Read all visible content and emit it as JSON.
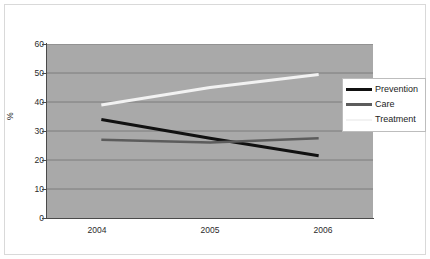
{
  "chart_data": {
    "type": "line",
    "title": "",
    "xlabel": "",
    "ylabel": "%",
    "categories": [
      "2004",
      "2005",
      "2006"
    ],
    "x": [
      2004,
      2005,
      2006
    ],
    "ylim": [
      0,
      60
    ],
    "yticks": [
      0,
      10,
      20,
      30,
      40,
      50,
      60
    ],
    "grid": true,
    "grid_axis": "y",
    "legend_position": "right",
    "plot_background": "#a9a9a9",
    "series": [
      {
        "name": "Prevention",
        "values": [
          34,
          27.5,
          21.5
        ],
        "color": "#111111",
        "width": 3
      },
      {
        "name": "Care",
        "values": [
          27,
          26,
          27.5
        ],
        "color": "#5c5c5c",
        "width": 2.5
      },
      {
        "name": "Treatment",
        "values": [
          39,
          45,
          49.5
        ],
        "color": "#f2f2f2",
        "width": 3
      }
    ]
  },
  "axes": {
    "y_tick_labels": [
      "60",
      "50",
      "40",
      "30",
      "20",
      "10",
      "0"
    ],
    "y_axis_title": "%",
    "x_tick_labels": [
      "2004",
      "2005",
      "2006"
    ]
  },
  "legend": {
    "items": [
      {
        "label": "Prevention",
        "color": "#111111"
      },
      {
        "label": "Care",
        "color": "#5c5c5c"
      },
      {
        "label": "Treatment",
        "color": "#f2f2f2"
      }
    ]
  }
}
